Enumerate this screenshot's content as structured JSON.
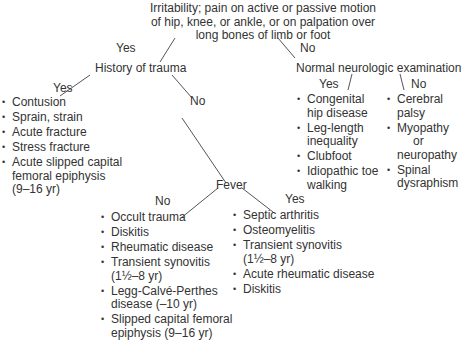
{
  "root": {
    "lines": [
      "Irritability; pain on active or passive motion",
      "of hip, knee, or ankle, or on palpation over",
      "long bones of limb or foot"
    ]
  },
  "root_branches": {
    "yes": "Yes",
    "no": "No"
  },
  "trauma": {
    "title": "History of trauma",
    "yes_label": "Yes",
    "no_label": "No",
    "yes_items": [
      "Contusion",
      "Sprain, strain",
      "Acute fracture",
      "Stress fracture",
      "Acute slipped capital",
      "femoral epiphysis",
      "(9–16 yr)"
    ]
  },
  "neuro": {
    "title": "Normal neurologic examination",
    "yes_label": "Yes",
    "no_label": "No",
    "yes_items": [
      "Congenital",
      "hip disease",
      "Leg-length",
      "inequality",
      "Clubfoot",
      "Idiopathic toe",
      "walking"
    ],
    "no_items": [
      "Cerebral",
      "palsy",
      "Myopathy",
      "or",
      "neuropathy",
      "Spinal",
      "dysraphism"
    ]
  },
  "fever": {
    "title": "Fever",
    "no_label": "No",
    "yes_label": "Yes",
    "no_items": [
      "Occult trauma",
      "Diskitis",
      "Rheumatic disease",
      "Transient synovitis",
      "(1½–8 yr)",
      "Legg-Calvé-Perthes",
      "disease (–10 yr)",
      "Slipped capital femoral",
      "epiphysis (9–16 yr)"
    ],
    "yes_items": [
      "Septic arthritis",
      "Osteomyelitis",
      "Transient synovitis",
      "(1½–8 yr)",
      "Acute rheumatic disease",
      "Diskitis"
    ]
  }
}
